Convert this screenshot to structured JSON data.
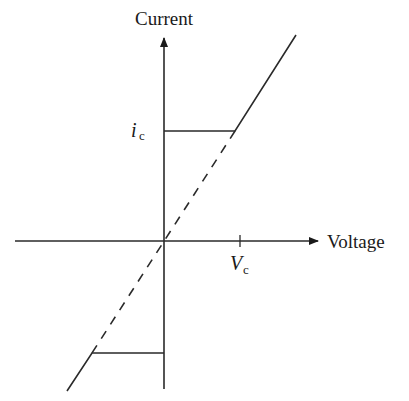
{
  "diagram": {
    "type": "current-voltage characteristic",
    "y_axis_label": "Current",
    "x_axis_label": "Voltage",
    "current_limit_label": {
      "main": "i",
      "sub": "c"
    },
    "voltage_limit_label": {
      "main": "V",
      "sub": "c"
    },
    "line_color": "#2a2a2a",
    "segments": [
      {
        "name": "upper-plateau",
        "style": "solid"
      },
      {
        "name": "upper-slope",
        "style": "solid"
      },
      {
        "name": "lower-plateau",
        "style": "solid"
      },
      {
        "name": "lower-slope",
        "style": "solid"
      },
      {
        "name": "linear-reference",
        "style": "dashed"
      }
    ]
  }
}
